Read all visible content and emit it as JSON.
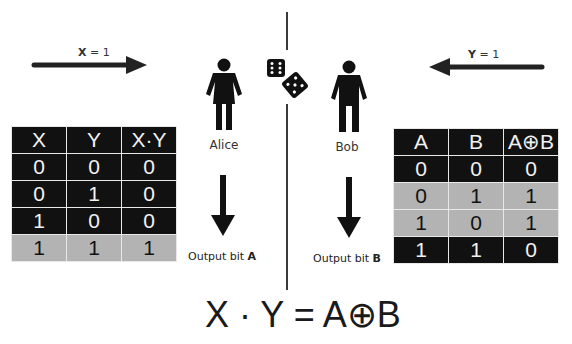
{
  "arrows": {
    "left": {
      "var": "X",
      "eq": " = 1",
      "direction": "right"
    },
    "right": {
      "var": "Y",
      "eq": " = 1",
      "direction": "left"
    }
  },
  "people": {
    "alice": {
      "name": "Alice",
      "icon": "female-person-icon"
    },
    "bob": {
      "name": "Bob",
      "icon": "male-person-icon"
    }
  },
  "dice": {
    "icon": "dice-icon"
  },
  "outputs": {
    "alice": {
      "text": "Output bit ",
      "bit": "A"
    },
    "bob": {
      "text": "Output bit ",
      "bit": "B"
    }
  },
  "table_left": {
    "headers": [
      "X",
      "Y",
      "X·Y"
    ],
    "rows": [
      {
        "cells": [
          "0",
          "0",
          "0"
        ],
        "shade": "dark"
      },
      {
        "cells": [
          "0",
          "1",
          "0"
        ],
        "shade": "dark"
      },
      {
        "cells": [
          "1",
          "0",
          "0"
        ],
        "shade": "dark"
      },
      {
        "cells": [
          "1",
          "1",
          "1"
        ],
        "shade": "light"
      }
    ]
  },
  "table_right": {
    "headers": [
      "A",
      "B",
      "A⊕B"
    ],
    "rows": [
      {
        "cells": [
          "0",
          "0",
          "0"
        ],
        "shade": "dark"
      },
      {
        "cells": [
          "0",
          "1",
          "1"
        ],
        "shade": "light"
      },
      {
        "cells": [
          "1",
          "0",
          "1"
        ],
        "shade": "light"
      },
      {
        "cells": [
          "1",
          "1",
          "0"
        ],
        "shade": "dark"
      }
    ]
  },
  "equation": {
    "lhs": "X · Y",
    "eq": " = ",
    "rhs": "A⊕B"
  },
  "colors": {
    "dark_cell": "#111111",
    "light_cell": "#b3b3b3",
    "ink": "#1a1a1a"
  }
}
